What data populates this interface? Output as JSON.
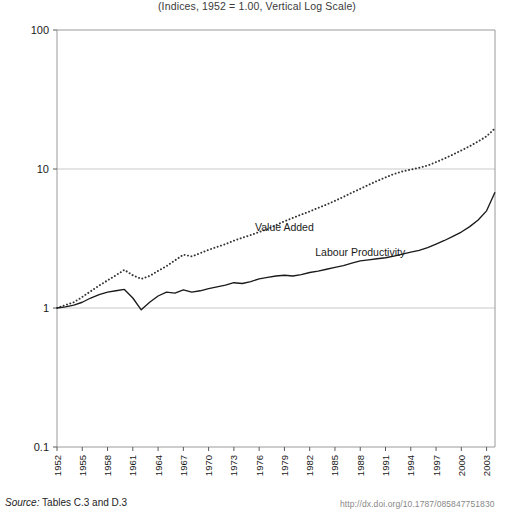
{
  "subtitle": "(Indices, 1952 = 1.00, Vertical Log Scale)",
  "footer": {
    "source_word": "Source:",
    "source_text": " Tables C.3 and D.3",
    "doi": "http://dx.doi.org/10.1787/085847751830"
  },
  "chart_data": {
    "type": "line",
    "title": "",
    "subtitle": "(Indices, 1952 = 1.00, Vertical Log Scale)",
    "xlabel": "",
    "ylabel": "",
    "yscale": "log",
    "ylim": [
      0.1,
      100
    ],
    "ytick_labels": [
      "100",
      "10",
      "1",
      "0.1"
    ],
    "ytick_values": [
      100,
      10,
      1,
      0.1
    ],
    "grid": "horizontal-major",
    "legend": "inline-annotations",
    "xlim": [
      1952,
      2004
    ],
    "xtick_labels": [
      "1952",
      "1955",
      "1958",
      "1961",
      "1964",
      "1967",
      "1970",
      "1973",
      "1976",
      "1979",
      "1982",
      "1985",
      "1988",
      "1991",
      "1994",
      "1997",
      "2000",
      "2003"
    ],
    "x": [
      1952,
      1953,
      1954,
      1955,
      1956,
      1957,
      1958,
      1959,
      1960,
      1961,
      1962,
      1963,
      1964,
      1965,
      1966,
      1967,
      1968,
      1969,
      1970,
      1971,
      1972,
      1973,
      1974,
      1975,
      1976,
      1977,
      1978,
      1979,
      1980,
      1981,
      1982,
      1983,
      1984,
      1985,
      1986,
      1987,
      1988,
      1989,
      1990,
      1991,
      1992,
      1993,
      1994,
      1995,
      1996,
      1997,
      1998,
      1999,
      2000,
      2001,
      2002,
      2003,
      2004
    ],
    "series": [
      {
        "name": "Value Added",
        "style": "dotted",
        "color": "#333333",
        "label_x": 1979,
        "label_y": 3.6,
        "values": [
          1.0,
          1.05,
          1.1,
          1.2,
          1.32,
          1.45,
          1.58,
          1.72,
          1.88,
          1.72,
          1.62,
          1.7,
          1.85,
          2.0,
          2.2,
          2.42,
          2.35,
          2.48,
          2.62,
          2.75,
          2.88,
          3.05,
          3.2,
          3.35,
          3.52,
          3.7,
          3.95,
          4.2,
          4.45,
          4.7,
          4.95,
          5.25,
          5.55,
          5.9,
          6.3,
          6.75,
          7.2,
          7.7,
          8.2,
          8.7,
          9.2,
          9.6,
          9.9,
          10.2,
          10.6,
          11.2,
          11.9,
          12.7,
          13.6,
          14.6,
          15.8,
          17.2,
          19.6
        ]
      },
      {
        "name": "Labour Productivity",
        "style": "solid",
        "color": "#1a1a1a",
        "label_x": 1988,
        "label_y": 2.35,
        "values": [
          1.0,
          1.02,
          1.05,
          1.1,
          1.18,
          1.25,
          1.3,
          1.33,
          1.36,
          1.18,
          0.97,
          1.1,
          1.22,
          1.3,
          1.28,
          1.35,
          1.3,
          1.33,
          1.38,
          1.42,
          1.46,
          1.52,
          1.5,
          1.55,
          1.62,
          1.66,
          1.7,
          1.72,
          1.7,
          1.74,
          1.8,
          1.84,
          1.9,
          1.96,
          2.02,
          2.1,
          2.18,
          2.22,
          2.26,
          2.3,
          2.36,
          2.44,
          2.52,
          2.6,
          2.72,
          2.88,
          3.06,
          3.28,
          3.52,
          3.85,
          4.3,
          5.0,
          6.8
        ]
      }
    ]
  }
}
